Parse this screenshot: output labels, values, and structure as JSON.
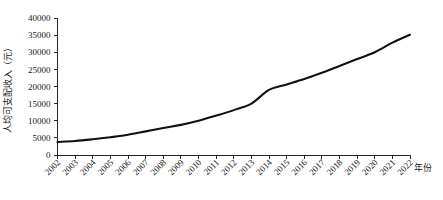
{
  "chart_data": {
    "type": "line",
    "title": "",
    "subtitle": "",
    "xlabel": "年份",
    "ylabel": "人均可支配收入（元）",
    "xlim": [
      2002,
      2022
    ],
    "ylim": [
      0,
      40000
    ],
    "grid": false,
    "legend": false,
    "legend_position": "none",
    "x_tick_labels": [
      "2002",
      "2003",
      "2004",
      "2005",
      "2006",
      "2007",
      "2008",
      "2009",
      "2010",
      "2011",
      "2012",
      "2013",
      "2014",
      "2015",
      "2016",
      "2017",
      "2018",
      "2019",
      "2020",
      "2021",
      "2022"
    ],
    "y_tick_labels": [
      "0",
      "5000",
      "10000",
      "15000",
      "20000",
      "25000",
      "30000",
      "35000",
      "40000"
    ],
    "y_ticks": [
      0,
      5000,
      10000,
      15000,
      20000,
      25000,
      30000,
      35000,
      40000
    ],
    "series": [
      {
        "name": "人均可支配收入",
        "color": "#111111",
        "x": [
          2002,
          2003,
          2004,
          2005,
          2006,
          2007,
          2008,
          2009,
          2010,
          2011,
          2012,
          2013,
          2014,
          2015,
          2016,
          2017,
          2018,
          2019,
          2020,
          2021,
          2022
        ],
        "values": [
          3800,
          4100,
          4600,
          5200,
          5900,
          6900,
          7900,
          8800,
          10000,
          11500,
          13100,
          15000,
          19000,
          20600,
          22200,
          24000,
          26000,
          28000,
          30000,
          32800,
          35100
        ]
      }
    ]
  },
  "axes": {
    "y_axis_title": "人均可支配收入（元）",
    "x_axis_title": "年份"
  }
}
